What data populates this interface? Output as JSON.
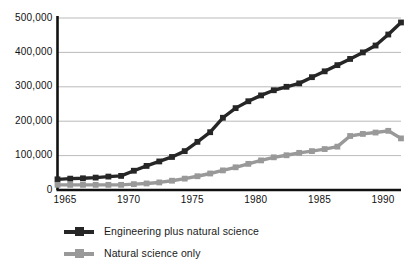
{
  "chart_data": {
    "type": "line",
    "title": "",
    "subtitle": "",
    "xlabel": "",
    "ylabel": "",
    "xlim": [
      1965,
      1992
    ],
    "ylim": [
      0,
      500000
    ],
    "grid": true,
    "legend_position": "bottom-left",
    "x_ticks": [
      "1965",
      "1970",
      "1975",
      "1980",
      "1985",
      "1990"
    ],
    "x_tick_values": [
      1965,
      1970,
      1975,
      1980,
      1985,
      1990
    ],
    "y_ticks": [
      "0",
      "100,000",
      "200,000",
      "300,000",
      "400,000",
      "500,000"
    ],
    "y_tick_values": [
      0,
      100000,
      200000,
      300000,
      400000,
      500000
    ],
    "x": [
      1965,
      1966,
      1967,
      1968,
      1969,
      1970,
      1971,
      1972,
      1973,
      1974,
      1975,
      1976,
      1977,
      1978,
      1979,
      1980,
      1981,
      1982,
      1983,
      1984,
      1985,
      1986,
      1987,
      1988,
      1989,
      1990,
      1991,
      1992
    ],
    "series": [
      {
        "name": "Engineering plus natural science",
        "color": "#262626",
        "marker": "square",
        "values": [
          31000,
          33000,
          34000,
          36000,
          39000,
          41000,
          56000,
          70000,
          83000,
          96000,
          113000,
          140000,
          168000,
          210000,
          238000,
          258000,
          275000,
          290000,
          300000,
          310000,
          328000,
          345000,
          363000,
          381000,
          400000,
          420000,
          452000,
          487000
        ]
      },
      {
        "name": "Natural science only",
        "color": "#999999",
        "marker": "square",
        "values": [
          15000,
          15000,
          15000,
          15000,
          15000,
          15000,
          17000,
          19000,
          22000,
          27000,
          33000,
          40000,
          48000,
          57000,
          66000,
          76000,
          86000,
          95000,
          101000,
          108000,
          113000,
          119000,
          126000,
          157000,
          163000,
          167000,
          172000,
          150000
        ]
      }
    ]
  },
  "axis": {
    "y_axis_name": "y-axis",
    "x_axis_name": "x-axis"
  },
  "legend": {
    "items": [
      {
        "label": "Engineering plus natural science",
        "color": "#262626"
      },
      {
        "label": "Natural science only",
        "color": "#999999"
      }
    ]
  }
}
